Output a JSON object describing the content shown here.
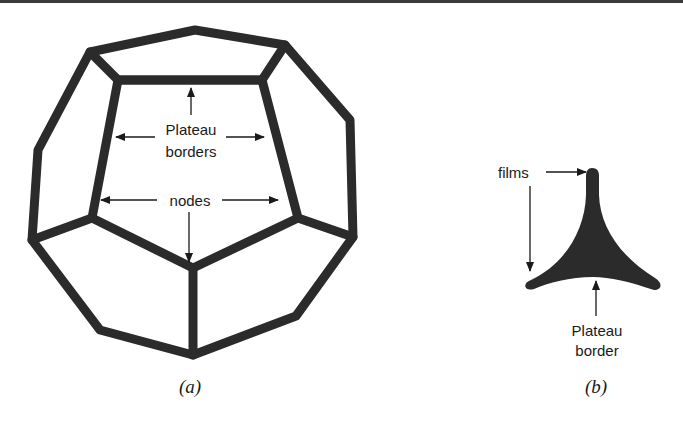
{
  "figure": {
    "panel_a": {
      "caption": "(a)",
      "labels": {
        "plateau_line1": "Plateau",
        "plateau_line2": "borders",
        "nodes": "nodes"
      }
    },
    "panel_b": {
      "caption": "(b)",
      "labels": {
        "films": "films",
        "plateau_line1": "Plateau",
        "plateau_line2": "border"
      }
    }
  },
  "colors": {
    "stroke": "#2b2b2b",
    "text": "#1a1a1a",
    "background": "#ffffff"
  }
}
